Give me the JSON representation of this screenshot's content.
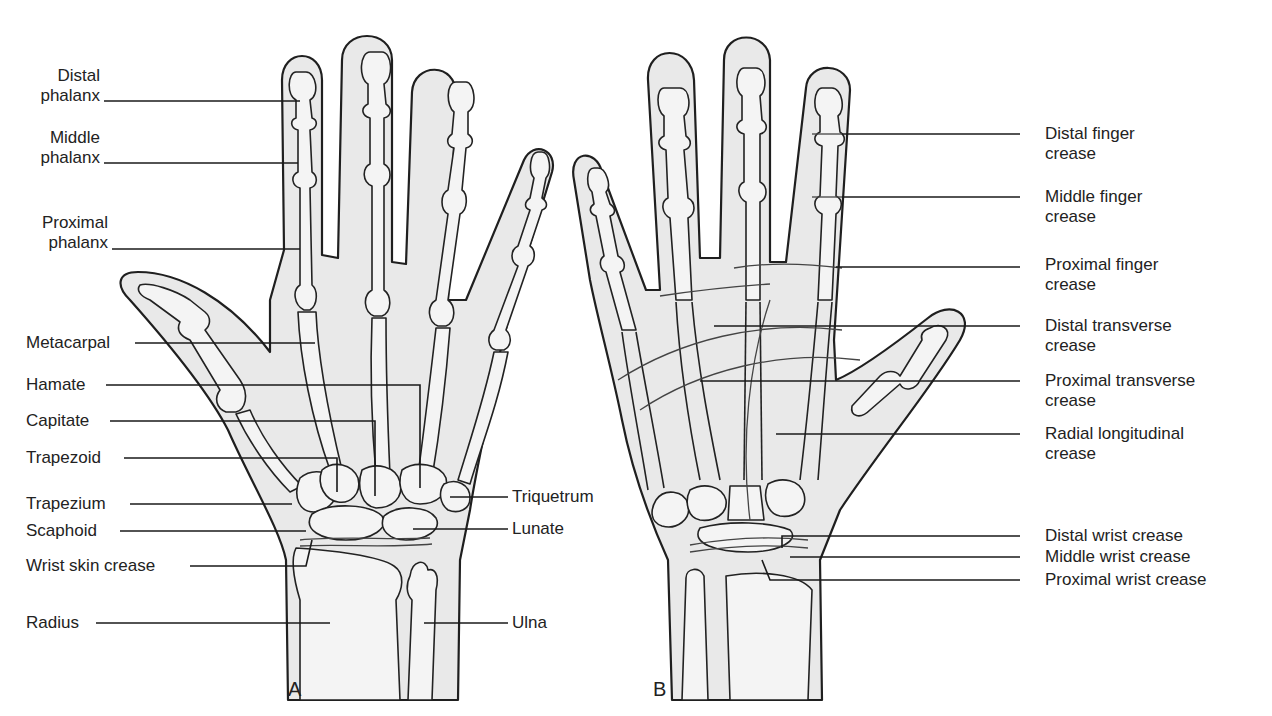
{
  "figure": {
    "panels": [
      {
        "id": "A",
        "letter": "A",
        "view": "dorsal bones of hand",
        "labels": [
          {
            "text": "Distal\nphalanx",
            "line1": "Distal",
            "line2": "phalanx"
          },
          {
            "text": "Middle\nphalanx",
            "line1": "Middle",
            "line2": "phalanx"
          },
          {
            "text": "Proximal\nphalanx",
            "line1": "Proximal",
            "line2": "phalanx"
          },
          {
            "text": "Metacarpal"
          },
          {
            "text": "Hamate"
          },
          {
            "text": "Capitate"
          },
          {
            "text": "Trapezoid"
          },
          {
            "text": "Trapezium"
          },
          {
            "text": "Scaphoid"
          },
          {
            "text": "Wrist skin crease"
          },
          {
            "text": "Radius"
          },
          {
            "text": "Triquetrum"
          },
          {
            "text": "Lunate"
          },
          {
            "text": "Ulna"
          }
        ]
      },
      {
        "id": "B",
        "letter": "B",
        "view": "palmar skin creases",
        "labels": [
          {
            "line1": "Distal finger",
            "line2": "crease"
          },
          {
            "line1": "Middle finger",
            "line2": "crease"
          },
          {
            "line1": "Proximal finger",
            "line2": "crease"
          },
          {
            "line1": "Distal transverse",
            "line2": "crease"
          },
          {
            "line1": "Proximal transverse",
            "line2": "crease"
          },
          {
            "line1": "Radial longitudinal",
            "line2": "crease"
          },
          {
            "text": "Distal wrist crease"
          },
          {
            "text": "Middle wrist crease"
          },
          {
            "text": "Proximal wrist crease"
          }
        ]
      }
    ],
    "colors": {
      "background": "#ffffff",
      "skin_fill": "#e9e9e9",
      "bone_fill": "#f4f4f4",
      "outline": "#1f1f1f",
      "text": "#222222"
    }
  }
}
